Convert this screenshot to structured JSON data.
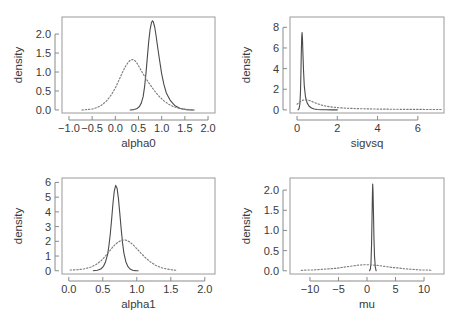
{
  "figure": {
    "background": "#ffffff",
    "panel_border_color": "#9a9a9a",
    "solid_color": "#4a4a4a",
    "dotted_color": "#7d7d7d",
    "ylabel_common": "density"
  },
  "chart_data": [
    {
      "type": "line",
      "title": "",
      "xlabel": "alpha0",
      "ylabel": "density",
      "xlim": [
        -1.15,
        2.15
      ],
      "ylim": [
        -0.08,
        2.45
      ],
      "xticks": [
        -1.0,
        -0.5,
        0.0,
        0.5,
        1.0,
        1.5,
        2.0
      ],
      "xticklabels": [
        "−1.0",
        "−0.5",
        "0.0",
        "0.5",
        "1.0",
        "1.5",
        "2.0"
      ],
      "yticks": [
        0.0,
        0.5,
        1.0,
        1.5,
        2.0
      ],
      "yticklabels": [
        "0.0",
        "0.5",
        "1.0",
        "1.5",
        "2.0"
      ],
      "grid": false,
      "legend": "none",
      "series": [
        {
          "name": "posterior",
          "style": "solid",
          "x": [
            0.32,
            0.4,
            0.46,
            0.52,
            0.56,
            0.6,
            0.63,
            0.66,
            0.69,
            0.72,
            0.75,
            0.78,
            0.8,
            0.82,
            0.85,
            0.88,
            0.91,
            0.95,
            1.0,
            1.05,
            1.1,
            1.18,
            1.28,
            1.4,
            1.52,
            1.62,
            1.7
          ],
          "y": [
            0.0,
            0.01,
            0.03,
            0.09,
            0.18,
            0.35,
            0.6,
            0.95,
            1.38,
            1.8,
            2.12,
            2.3,
            2.35,
            2.32,
            2.18,
            1.95,
            1.68,
            1.35,
            0.95,
            0.66,
            0.45,
            0.26,
            0.12,
            0.04,
            0.01,
            0.0,
            0.0
          ]
        },
        {
          "name": "prior",
          "style": "dotted",
          "x": [
            -0.72,
            -0.6,
            -0.48,
            -0.38,
            -0.28,
            -0.18,
            -0.08,
            0.0,
            0.08,
            0.15,
            0.22,
            0.28,
            0.33,
            0.38,
            0.43,
            0.48,
            0.54,
            0.6,
            0.66,
            0.72,
            0.8,
            0.88,
            0.96,
            1.05,
            1.15,
            1.25,
            1.38,
            1.5,
            1.62,
            1.7
          ],
          "y": [
            0.0,
            0.01,
            0.03,
            0.07,
            0.14,
            0.25,
            0.41,
            0.58,
            0.79,
            0.98,
            1.15,
            1.26,
            1.32,
            1.33,
            1.29,
            1.21,
            1.08,
            0.95,
            0.83,
            0.72,
            0.58,
            0.45,
            0.34,
            0.24,
            0.15,
            0.09,
            0.04,
            0.02,
            0.01,
            0.0
          ]
        }
      ]
    },
    {
      "type": "line",
      "title": "",
      "xlabel": "sigvsq",
      "ylabel": "density",
      "xlim": [
        -0.35,
        7.3
      ],
      "ylim": [
        -0.3,
        9.0
      ],
      "xticks": [
        0,
        2,
        4,
        6
      ],
      "xticklabels": [
        "0",
        "2",
        "4",
        "6"
      ],
      "yticks": [
        0,
        2,
        4,
        6,
        8
      ],
      "yticklabels": [
        "0",
        "2",
        "4",
        "6",
        "8"
      ],
      "grid": false,
      "legend": "none",
      "series": [
        {
          "name": "posterior",
          "style": "solid",
          "x": [
            0.05,
            0.1,
            0.14,
            0.17,
            0.19,
            0.21,
            0.23,
            0.25,
            0.27,
            0.29,
            0.32,
            0.36,
            0.42,
            0.5,
            0.6,
            0.72,
            0.85,
            1.0,
            1.2,
            1.45,
            1.7,
            2.0
          ],
          "y": [
            0.0,
            0.12,
            0.55,
            1.7,
            3.3,
            5.4,
            7.0,
            7.5,
            6.9,
            5.6,
            3.9,
            2.3,
            1.25,
            0.68,
            0.36,
            0.18,
            0.09,
            0.04,
            0.02,
            0.01,
            0.0,
            0.0
          ]
        },
        {
          "name": "prior",
          "style": "dotted",
          "x": [
            0.0,
            0.15,
            0.3,
            0.45,
            0.6,
            0.75,
            0.9,
            1.1,
            1.3,
            1.5,
            1.8,
            2.1,
            2.5,
            3.0,
            3.5,
            4.0,
            4.5,
            5.0,
            5.5,
            6.0,
            6.5,
            7.0,
            7.25
          ],
          "y": [
            0.55,
            0.8,
            0.95,
            0.98,
            0.92,
            0.8,
            0.68,
            0.54,
            0.42,
            0.34,
            0.26,
            0.21,
            0.16,
            0.12,
            0.1,
            0.08,
            0.07,
            0.06,
            0.05,
            0.05,
            0.04,
            0.04,
            0.04
          ]
        }
      ]
    },
    {
      "type": "line",
      "title": "",
      "xlabel": "alpha1",
      "ylabel": "density",
      "xlim": [
        -0.1,
        2.15
      ],
      "ylim": [
        -0.22,
        6.3
      ],
      "xticks": [
        0.0,
        0.5,
        1.0,
        1.5,
        2.0
      ],
      "xticklabels": [
        "0.0",
        "0.5",
        "1.0",
        "1.5",
        "2.0"
      ],
      "yticks": [
        0,
        1,
        2,
        3,
        4,
        5,
        6
      ],
      "yticklabels": [
        "0",
        "1",
        "2",
        "3",
        "4",
        "5",
        "6"
      ],
      "grid": false,
      "legend": "none",
      "series": [
        {
          "name": "posterior",
          "style": "solid",
          "x": [
            0.36,
            0.42,
            0.47,
            0.51,
            0.54,
            0.57,
            0.59,
            0.61,
            0.63,
            0.65,
            0.67,
            0.69,
            0.71,
            0.73,
            0.75,
            0.77,
            0.79,
            0.81,
            0.84,
            0.87,
            0.9,
            0.94,
            0.98,
            1.02
          ],
          "y": [
            0.0,
            0.04,
            0.12,
            0.3,
            0.6,
            1.1,
            1.7,
            2.5,
            3.5,
            4.6,
            5.45,
            5.8,
            5.6,
            4.9,
            3.9,
            2.85,
            1.9,
            1.2,
            0.6,
            0.28,
            0.12,
            0.04,
            0.01,
            0.0
          ]
        },
        {
          "name": "prior",
          "style": "dotted",
          "x": [
            0.02,
            0.12,
            0.22,
            0.32,
            0.4,
            0.47,
            0.53,
            0.58,
            0.63,
            0.68,
            0.73,
            0.78,
            0.82,
            0.86,
            0.9,
            0.95,
            1.0,
            1.06,
            1.12,
            1.2,
            1.28,
            1.36,
            1.44,
            1.52,
            1.6
          ],
          "y": [
            0.05,
            0.07,
            0.12,
            0.24,
            0.42,
            0.66,
            0.95,
            1.22,
            1.52,
            1.78,
            1.96,
            2.08,
            2.1,
            2.05,
            1.94,
            1.74,
            1.5,
            1.2,
            0.92,
            0.6,
            0.36,
            0.21,
            0.12,
            0.06,
            0.02
          ]
        }
      ]
    },
    {
      "type": "line",
      "title": "",
      "xlabel": "mu",
      "ylabel": "density",
      "xlim": [
        -13.5,
        13.5
      ],
      "ylim": [
        -0.08,
        2.3
      ],
      "xticks": [
        -10,
        -5,
        0,
        5,
        10
      ],
      "xticklabels": [
        "−10",
        "−5",
        "0",
        "5",
        "10"
      ],
      "yticks": [
        0.0,
        0.5,
        1.0,
        1.5,
        2.0
      ],
      "yticklabels": [
        "0.0",
        "0.5",
        "1.0",
        "1.5",
        "2.0"
      ],
      "grid": false,
      "legend": "none",
      "series": [
        {
          "name": "posterior",
          "style": "solid",
          "x": [
            0.45,
            0.6,
            0.7,
            0.8,
            0.88,
            0.95,
            1.0,
            1.06,
            1.14,
            1.22,
            1.32,
            1.45,
            1.6
          ],
          "y": [
            0.0,
            0.05,
            0.2,
            0.65,
            1.3,
            1.9,
            2.15,
            1.95,
            1.4,
            0.8,
            0.35,
            0.1,
            0.0
          ]
        },
        {
          "name": "prior",
          "style": "dotted",
          "x": [
            -11.5,
            -10.5,
            -9.5,
            -8.5,
            -7.5,
            -6.5,
            -5.5,
            -4.5,
            -3.5,
            -2.5,
            -1.5,
            -0.5,
            0.5,
            1.0,
            1.5,
            2.5,
            3.5,
            4.5,
            5.5,
            6.5,
            7.5,
            8.5,
            9.5,
            10.5,
            11.5
          ],
          "y": [
            0.01,
            0.02,
            0.02,
            0.03,
            0.04,
            0.05,
            0.06,
            0.08,
            0.1,
            0.12,
            0.14,
            0.15,
            0.15,
            0.14,
            0.14,
            0.12,
            0.1,
            0.08,
            0.07,
            0.05,
            0.04,
            0.03,
            0.02,
            0.02,
            0.01
          ]
        }
      ]
    }
  ]
}
